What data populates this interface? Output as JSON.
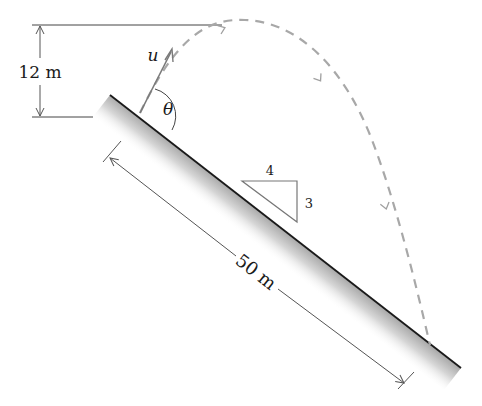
{
  "diagram": {
    "labels": {
      "height_dimension": "12 m",
      "incline_length": "50 m",
      "velocity": "u",
      "angle": "θ",
      "slope_run": "4",
      "slope_rise": "3"
    },
    "elements": {
      "incline": {
        "description": "inclined plane with gradient shading, slope 3:4"
      },
      "trajectory": {
        "description": "dashed parabolic path from launch point, peak 12 m above launch, landing on incline",
        "style": "dashed",
        "arrows": 3
      },
      "velocity_vector": {
        "description": "initial velocity u at angle θ to incline"
      },
      "height_dimension_line": {
        "description": "vertical dimension between launch level and apex level"
      },
      "length_dimension_line": {
        "description": "dimension along incline, 50 m"
      },
      "slope_triangle": {
        "description": "right triangle showing 4 horizontal : 3 vertical"
      }
    },
    "colors": {
      "line": "#1a1a1a",
      "dimension": "#555555",
      "trajectory": "#a8a8a8",
      "velocity": "#7a7a7a",
      "shading": "#bdbdbd"
    }
  }
}
